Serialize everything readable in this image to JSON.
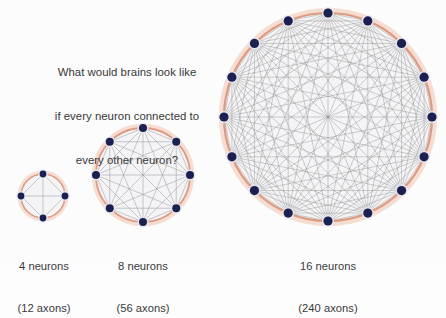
{
  "figure": {
    "background_color": "#fcfcfc",
    "question": {
      "line1": "What would brains look like",
      "line2": "if every neuron connected to",
      "line3": "every other neuron?",
      "text_color": "#383838"
    },
    "palette": {
      "node_fill": "#1c2050",
      "node_halo": "#e8eaf2",
      "ring_inner": "#d98a6d",
      "ring_outer": "#efc3ae",
      "edge_color": "#8c8c8c",
      "disk_fill": "#f3f3f5",
      "label_color": "#3a3a3a"
    },
    "graphs": [
      {
        "id": "graph-4",
        "name": "four-neuron-complete-graph",
        "nodes": 4,
        "edges": 12,
        "label_line1": "4 neurons",
        "label_line2": "(12 axons)",
        "center_x": 43,
        "center_y": 196,
        "radius": 22,
        "node_radius": 3.4,
        "edge_width": 0.55,
        "ring_width": 1.5
      },
      {
        "id": "graph-8",
        "name": "eight-neuron-complete-graph",
        "nodes": 8,
        "edges": 56,
        "label_line1": "8 neurons",
        "label_line2": "(56 axons)",
        "center_x": 143,
        "center_y": 175,
        "radius": 47,
        "node_radius": 4.0,
        "edge_width": 0.55,
        "ring_width": 1.8
      },
      {
        "id": "graph-16",
        "name": "sixteen-neuron-complete-graph",
        "nodes": 16,
        "edges": 240,
        "label_line1": "16 neurons",
        "label_line2": "(240 axons)",
        "center_x": 328,
        "center_y": 117,
        "radius": 104,
        "node_radius": 4.6,
        "edge_width": 0.5,
        "ring_width": 2.2
      }
    ]
  },
  "chart_data": {
    "type": "diagram",
    "title": "What would brains look like if every neuron connected to every other neuron?",
    "categories": [
      "4 neurons",
      "8 neurons",
      "16 neurons"
    ],
    "node_counts": [
      4,
      8,
      16
    ],
    "edge_counts": [
      12,
      56,
      240
    ],
    "xlabel": "",
    "ylabel": "axons",
    "legend": []
  }
}
